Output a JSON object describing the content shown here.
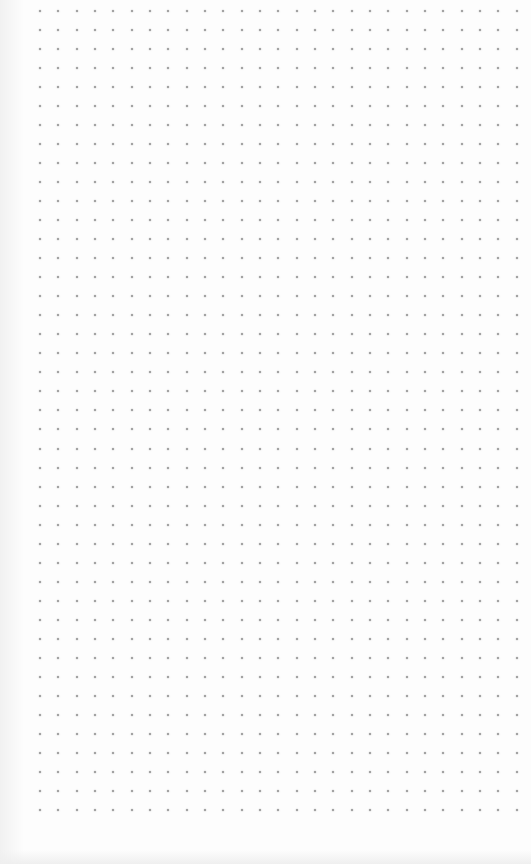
{
  "canvas": {
    "type": "dot-grid-paper",
    "background_color": "#fdfdfd",
    "dot_color": "#8f8f8f"
  },
  "grid": {
    "origin_x": 40,
    "origin_y": 11,
    "spacing_x": 18.33,
    "spacing_y": 19.02,
    "columns": 27,
    "rows": 43,
    "dot_size": 2
  }
}
